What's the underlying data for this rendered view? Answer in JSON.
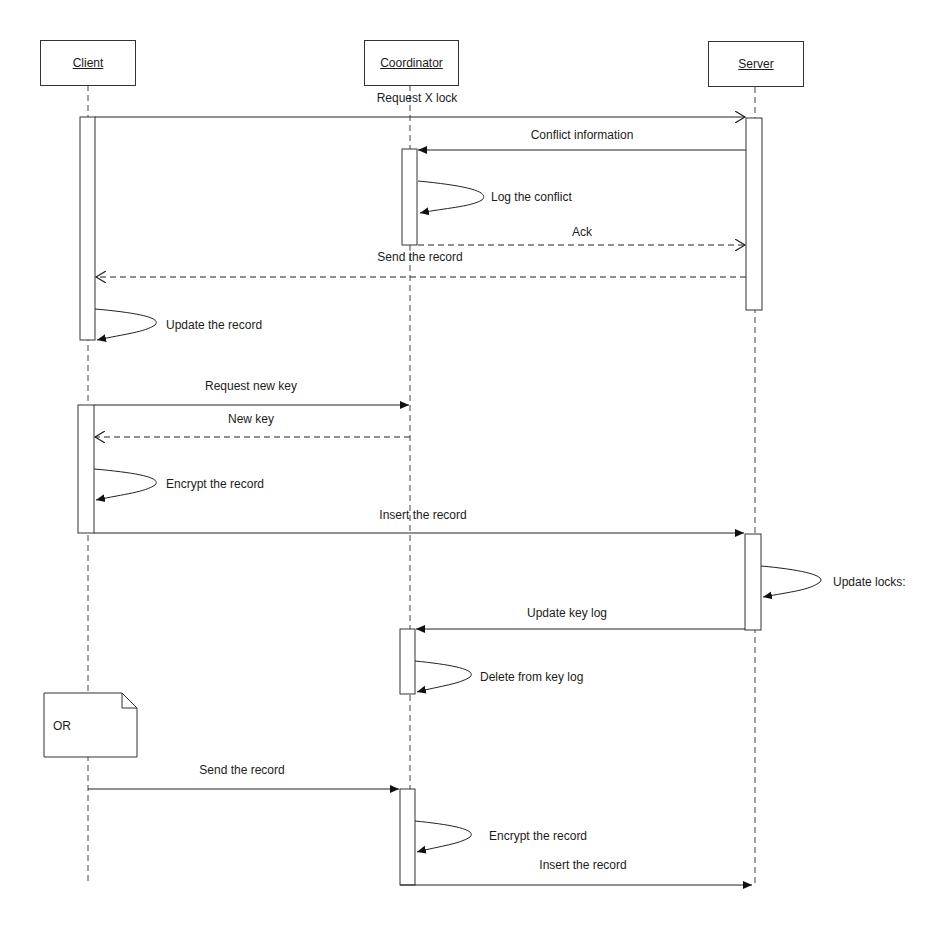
{
  "diagram": {
    "type": "sequence",
    "participants": [
      {
        "id": "client",
        "label": "Client"
      },
      {
        "id": "coordinator",
        "label": "Coordinator"
      },
      {
        "id": "server",
        "label": "Server"
      }
    ],
    "messages": [
      {
        "from": "client",
        "to": "server",
        "label": "Request X lock",
        "style": "solid-open"
      },
      {
        "from": "server",
        "to": "coordinator",
        "label": "Conflict information",
        "style": "solid-filled"
      },
      {
        "from": "coordinator",
        "to": "coordinator",
        "label": "Log the conflict",
        "style": "self"
      },
      {
        "from": "coordinator",
        "to": "server",
        "label": "Ack",
        "style": "dashed-open"
      },
      {
        "from": "server",
        "to": "client",
        "label": "Send the record",
        "style": "dashed-open"
      },
      {
        "from": "client",
        "to": "client",
        "label": "Update the record",
        "style": "self"
      },
      {
        "from": "client",
        "to": "coordinator",
        "label": "Request new key",
        "style": "solid-filled"
      },
      {
        "from": "coordinator",
        "to": "client",
        "label": "New key",
        "style": "dashed-open"
      },
      {
        "from": "client",
        "to": "client",
        "label": "Encrypt the record",
        "style": "self"
      },
      {
        "from": "client",
        "to": "server",
        "label": "Insert the record",
        "style": "solid-filled"
      },
      {
        "from": "server",
        "to": "server",
        "label": "Update locks:",
        "style": "self"
      },
      {
        "from": "server",
        "to": "coordinator",
        "label": "Update key log",
        "style": "solid-filled"
      },
      {
        "from": "coordinator",
        "to": "coordinator",
        "label": "Delete from key log",
        "style": "self"
      },
      {
        "from": "client",
        "to": "coordinator",
        "label": "Send the record",
        "style": "solid-filled"
      },
      {
        "from": "coordinator",
        "to": "coordinator",
        "label": "Encrypt the record",
        "style": "self"
      },
      {
        "from": "coordinator",
        "to": "server",
        "label": "Insert the record",
        "style": "solid-filled"
      }
    ],
    "note": {
      "label": "OR"
    }
  }
}
